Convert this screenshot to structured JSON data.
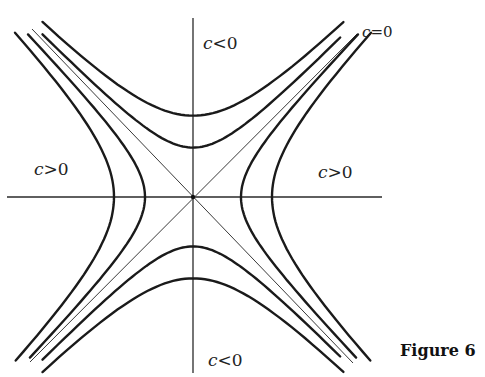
{
  "figure": {
    "caption": "Figure 6",
    "center": [
      193,
      197
    ],
    "colors": {
      "curve": "#1a1a1a",
      "axis": "#2a2a2a",
      "asymptote": "#3a3a3a"
    },
    "axes": {
      "horizontal": {
        "x1": 7,
        "x2": 382,
        "y": 197
      },
      "vertical": {
        "x": 193,
        "y1": 18,
        "y2": 373
      }
    },
    "asymptotes": {
      "label": "c=0",
      "lines": [
        {
          "x1": 32,
          "y1": 29,
          "x2": 353,
          "y2": 363
        },
        {
          "x1": 357,
          "y1": 34,
          "x2": 30,
          "y2": 362
        }
      ]
    },
    "hyperbolas": {
      "c_positive": {
        "label": "c>0",
        "vertex_offsets": [
          48,
          79
        ],
        "orientation": "horizontal"
      },
      "c_negative": {
        "label": "c<0",
        "vertex_offsets": [
          48,
          79
        ],
        "orientation": "vertical"
      }
    },
    "labels": [
      {
        "id": "c-neg-top",
        "var": "c",
        "rel": "<",
        "val": "0",
        "x": 203,
        "y": 33
      },
      {
        "id": "c-zero",
        "var": "c",
        "rel": "=",
        "val": "0",
        "x": 362,
        "y": 23
      },
      {
        "id": "c-pos-left",
        "var": "c",
        "rel": ">",
        "val": "0",
        "x": 34,
        "y": 159
      },
      {
        "id": "c-pos-right",
        "var": "c",
        "rel": ">",
        "val": "0",
        "x": 318,
        "y": 162
      },
      {
        "id": "c-neg-bottom",
        "var": "c",
        "rel": "<",
        "val": "0",
        "x": 208,
        "y": 350
      }
    ]
  }
}
